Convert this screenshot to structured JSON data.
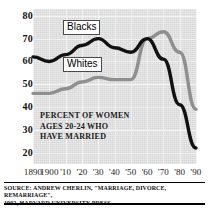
{
  "chart_data": {
    "type": "line",
    "title": "",
    "annotation": [
      "PERCENT OF WOMEN",
      "AGES 20-24 WHO",
      "HAVE MARRIED"
    ],
    "xlabel": "",
    "ylabel": "",
    "ylim": [
      15,
      83
    ],
    "xlim": [
      1890,
      1990
    ],
    "grid": true,
    "legend_position": "inline-labels",
    "x": [
      1890,
      1900,
      1910,
      1920,
      1930,
      1940,
      1950,
      1960,
      1970,
      1980,
      1990
    ],
    "x_tick_labels": [
      "1890",
      "1900",
      "'10",
      "'20",
      "'30",
      "'40",
      "'50",
      "'60",
      "'70",
      "'80",
      "'90"
    ],
    "y_tick_labels": [
      "80",
      "70",
      "60",
      "50",
      "40",
      "30",
      "20"
    ],
    "y_ticks": [
      80,
      70,
      60,
      50,
      40,
      30,
      20
    ],
    "series": [
      {
        "name": "Blacks",
        "color": "#111111",
        "values": [
          62,
          60,
          63,
          67,
          70,
          66,
          64,
          70,
          61,
          41,
          22
        ]
      },
      {
        "name": "Whites",
        "color": "#8f8f8f",
        "values": [
          46,
          46,
          48,
          51,
          53,
          52,
          52,
          70,
          73,
          64,
          39
        ]
      }
    ]
  },
  "axis": {
    "y_ticks": [
      {
        "label": "80",
        "value": 80
      },
      {
        "label": "70",
        "value": 70
      },
      {
        "label": "60",
        "value": 60
      },
      {
        "label": "50",
        "value": 50
      },
      {
        "label": "40",
        "value": 40
      },
      {
        "label": "30",
        "value": 30
      },
      {
        "label": "20",
        "value": 20
      }
    ],
    "x_ticks": [
      {
        "label": "1890",
        "value": 1890
      },
      {
        "label": "1900",
        "value": 1900
      },
      {
        "label": "'10",
        "value": 1910
      },
      {
        "label": "'20",
        "value": 1920
      },
      {
        "label": "'30",
        "value": 1930
      },
      {
        "label": "'40",
        "value": 1940
      },
      {
        "label": "'50",
        "value": 1950
      },
      {
        "label": "'60",
        "value": 1960
      },
      {
        "label": "'70",
        "value": 1970
      },
      {
        "label": "'80",
        "value": 1980
      },
      {
        "label": "'90",
        "value": 1990
      }
    ]
  },
  "labels": {
    "blacks": "Blacks",
    "whites": "Whites"
  },
  "annotation": {
    "line1": "PERCENT OF WOMEN",
    "line2": "AGES 20-24 WHO",
    "line3": "HAVE MARRIED"
  },
  "footer": {
    "source_line1": "SOURCE: ANDREW CHERLIN, \"MARRIAGE, DIVORCE, REMARRIAGE\",",
    "source_line2": "1992, HARVARD UNIVERSITY PRESS"
  },
  "colors": {
    "blacks_series": "#111111",
    "whites_series": "#8f8f8f",
    "plot_background": "#d6d6d6",
    "grid": "#f2f2f2"
  }
}
